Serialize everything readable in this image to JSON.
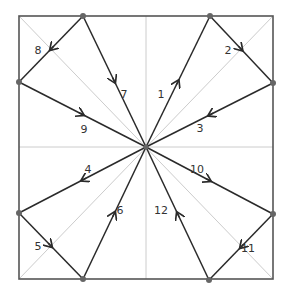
{
  "diagram": {
    "type": "folding-crease-pattern",
    "colors": {
      "border": "#555555",
      "guide": "#cccccc",
      "edge": "#2a2a2a",
      "point": "#666666",
      "label": "#333333"
    },
    "square": {
      "x1": 19,
      "y1": 16,
      "x2": 273,
      "y2": 279
    },
    "center": {
      "x": 146,
      "y": 147
    },
    "points": {
      "T1": {
        "x": 83,
        "y": 16
      },
      "T2": {
        "x": 210,
        "y": 16
      },
      "R1": {
        "x": 273,
        "y": 83
      },
      "R2": {
        "x": 273,
        "y": 214
      },
      "B2": {
        "x": 209,
        "y": 280
      },
      "B1": {
        "x": 83,
        "y": 279
      },
      "L2": {
        "x": 19,
        "y": 213
      },
      "L1": {
        "x": 19,
        "y": 82
      }
    },
    "edges": [
      {
        "label": "1",
        "from": "C",
        "to": "T2",
        "lx": 161,
        "ly": 98
      },
      {
        "label": "2",
        "from": "T2",
        "to": "R1",
        "lx": 228,
        "ly": 54
      },
      {
        "label": "3",
        "from": "R1",
        "to": "C",
        "lx": 200,
        "ly": 132
      },
      {
        "label": "4",
        "from": "C",
        "to": "L2",
        "lx": 88,
        "ly": 173
      },
      {
        "label": "5",
        "from": "L2",
        "to": "B1",
        "lx": 38,
        "ly": 250
      },
      {
        "label": "6",
        "from": "B1",
        "to": "C",
        "lx": 120,
        "ly": 214
      },
      {
        "label": "7",
        "from": "T1",
        "to": "C",
        "lx": 124,
        "ly": 98
      },
      {
        "label": "8",
        "from": "T1",
        "to": "L1",
        "lx": 38,
        "ly": 54
      },
      {
        "label": "9",
        "from": "L1",
        "to": "C",
        "lx": 84,
        "ly": 133
      },
      {
        "label": "10",
        "from": "C",
        "to": "R2",
        "lx": 197,
        "ly": 173
      },
      {
        "label": "11",
        "from": "R2",
        "to": "B2",
        "lx": 248,
        "ly": 252
      },
      {
        "label": "12",
        "from": "B2",
        "to": "C",
        "lx": 161,
        "ly": 214
      }
    ]
  }
}
